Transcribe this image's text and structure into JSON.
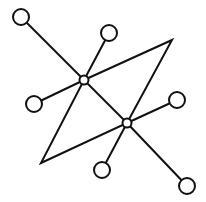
{
  "diagram": {
    "type": "graph",
    "stroke_color": "#111111",
    "background": "#ffffff",
    "hubs": [
      {
        "id": "hub-a",
        "x": 84,
        "y": 80,
        "r": 4.5
      },
      {
        "id": "hub-b",
        "x": 127,
        "y": 123,
        "r": 4.5
      }
    ],
    "leaves": [
      {
        "id": "leaf-top-left",
        "x": 21,
        "y": 17,
        "r": 8,
        "hub": "hub-a"
      },
      {
        "id": "leaf-top",
        "x": 109,
        "y": 33,
        "r": 8,
        "hub": "hub-a"
      },
      {
        "id": "leaf-left",
        "x": 34,
        "y": 104,
        "r": 8,
        "hub": "hub-a"
      },
      {
        "id": "leaf-right",
        "x": 177,
        "y": 100,
        "r": 8,
        "hub": "hub-b"
      },
      {
        "id": "leaf-bottom",
        "x": 102,
        "y": 170,
        "r": 8,
        "hub": "hub-b"
      },
      {
        "id": "leaf-bottom-right",
        "x": 187,
        "y": 186,
        "r": 8,
        "hub": "hub-b"
      }
    ],
    "quadrilateral": {
      "points": [
        [
          84,
          80
        ],
        [
          172,
          40
        ],
        [
          127,
          123
        ],
        [
          41,
          163
        ]
      ]
    },
    "hub_link": {
      "from": "hub-a",
      "to": "hub-b"
    }
  }
}
